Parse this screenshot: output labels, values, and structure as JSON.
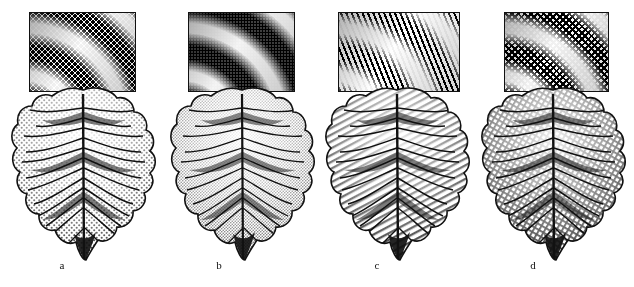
{
  "figure": {
    "background_color": "#ffffff",
    "ink_color": "#111111",
    "width": 634,
    "height": 287,
    "panel_count": 4
  },
  "panels": [
    {
      "label": "a",
      "label_x": 62,
      "label_y": 266,
      "technique": "coarse-stipple",
      "technique_name": "Coarse stipple (dot) shading",
      "inset": {
        "x": 29,
        "y": 12,
        "width": 107,
        "height": 80
      },
      "leaf": {
        "x": 8,
        "y": 84,
        "width": 150,
        "height": 180
      },
      "subject": "leaf",
      "icon": "leaf-icon"
    },
    {
      "label": "b",
      "label_x": 219,
      "label_y": 266,
      "technique": "fine-stipple",
      "technique_name": "Fine stipple (dither) shading",
      "inset": {
        "x": 188,
        "y": 12,
        "width": 107,
        "height": 80
      },
      "leaf": {
        "x": 167,
        "y": 84,
        "width": 150,
        "height": 180
      },
      "subject": "leaf",
      "icon": "leaf-icon"
    },
    {
      "label": "c",
      "label_x": 377,
      "label_y": 266,
      "technique": "curved-line-hatch",
      "technique_name": "Curved line hatching",
      "inset": {
        "x": 338,
        "y": 12,
        "width": 122,
        "height": 80
      },
      "leaf": {
        "x": 322,
        "y": 84,
        "width": 150,
        "height": 180
      },
      "subject": "leaf",
      "icon": "leaf-icon"
    },
    {
      "label": "d",
      "label_x": 533,
      "label_y": 266,
      "technique": "cross-hatch",
      "technique_name": "Cross-hatch / halftone grid",
      "inset": {
        "x": 504,
        "y": 12,
        "width": 105,
        "height": 80
      },
      "leaf": {
        "x": 478,
        "y": 84,
        "width": 150,
        "height": 180
      },
      "subject": "leaf",
      "icon": "leaf-icon"
    }
  ]
}
